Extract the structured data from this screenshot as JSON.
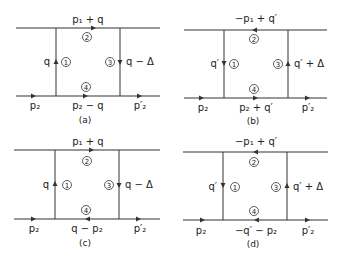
{
  "figure": {
    "panels": [
      {
        "id": "a",
        "caption": "(a)",
        "top_label": "p₁ + q",
        "bottom_mid_label": "p₂ − q",
        "bottom_left_label": "p₂",
        "bottom_right_label": "p′₂",
        "left_label": "q",
        "right_label": "q − Δ",
        "vertex_numbers": [
          "1",
          "2",
          "3",
          "4"
        ],
        "arrows": {
          "top": "right",
          "left": "up",
          "right": "down",
          "bottom_mid": "right"
        }
      },
      {
        "id": "b",
        "caption": "(b)",
        "top_label": "−p₁ + q′",
        "bottom_mid_label": "p₂ + q′",
        "bottom_left_label": "p₂",
        "bottom_right_label": "p′₂",
        "left_label": "q′",
        "right_label": "q′ + Δ",
        "vertex_numbers": [
          "1",
          "2",
          "3",
          "4"
        ],
        "arrows": {
          "top": "left",
          "left": "down",
          "right": "up",
          "bottom_mid": "right"
        }
      },
      {
        "id": "c",
        "caption": "(c)",
        "top_label": "p₁ + q",
        "bottom_mid_label": "q − p₂",
        "bottom_left_label": "p₂",
        "bottom_right_label": "p′₂",
        "left_label": "q",
        "right_label": "q − Δ",
        "vertex_numbers": [
          "1",
          "2",
          "3",
          "4"
        ],
        "arrows": {
          "top": "right",
          "left": "up",
          "right": "down",
          "bottom_mid": "left"
        }
      },
      {
        "id": "d",
        "caption": "(d)",
        "top_label": "−p₁ + q′",
        "bottom_mid_label": "−q′ − p₂",
        "bottom_left_label": "p₂",
        "bottom_right_label": "p′₂",
        "left_label": "q′",
        "right_label": "q′ + Δ",
        "vertex_numbers": [
          "1",
          "2",
          "3",
          "4"
        ],
        "arrows": {
          "top": "left",
          "left": "down",
          "right": "up",
          "bottom_mid": "left"
        }
      }
    ]
  }
}
